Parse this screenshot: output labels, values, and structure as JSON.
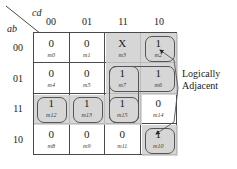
{
  "figure": {
    "type": "karnaugh-map",
    "variables": {
      "row_label": "ab",
      "col_label": "cd"
    },
    "col_headers": [
      "00",
      "01",
      "11",
      "10"
    ],
    "row_headers": [
      "00",
      "01",
      "11",
      "10"
    ],
    "cells": [
      {
        "value": "0",
        "minterm": "m0",
        "shaded": false
      },
      {
        "value": "0",
        "minterm": "m1",
        "shaded": false
      },
      {
        "value": "X",
        "minterm": "m3",
        "shaded": true
      },
      {
        "value": "1",
        "minterm": "m2",
        "shaded": true
      },
      {
        "value": "0",
        "minterm": "m4",
        "shaded": false
      },
      {
        "value": "0",
        "minterm": "m5",
        "shaded": false
      },
      {
        "value": "1",
        "minterm": "m7",
        "shaded": true
      },
      {
        "value": "1",
        "minterm": "m6",
        "shaded": true
      },
      {
        "value": "1",
        "minterm": "m12",
        "shaded": true
      },
      {
        "value": "1",
        "minterm": "m13",
        "shaded": true
      },
      {
        "value": "1",
        "minterm": "m15",
        "shaded": true
      },
      {
        "value": "0",
        "minterm": "m14",
        "shaded": false
      },
      {
        "value": "0",
        "minterm": "m8",
        "shaded": false
      },
      {
        "value": "0",
        "minterm": "m9",
        "shaded": false
      },
      {
        "value": "0",
        "minterm": "m11",
        "shaded": false
      },
      {
        "value": "1",
        "minterm": "m10",
        "shaded": true
      }
    ],
    "annotation": {
      "line1": "Logically",
      "line2": "Adjacent"
    },
    "colors": {
      "shade": "#cfcfcf",
      "grid_line": "#4a4a4a",
      "outline": "#555555",
      "text": "#1a1a1a",
      "background": "#ffffff"
    }
  }
}
